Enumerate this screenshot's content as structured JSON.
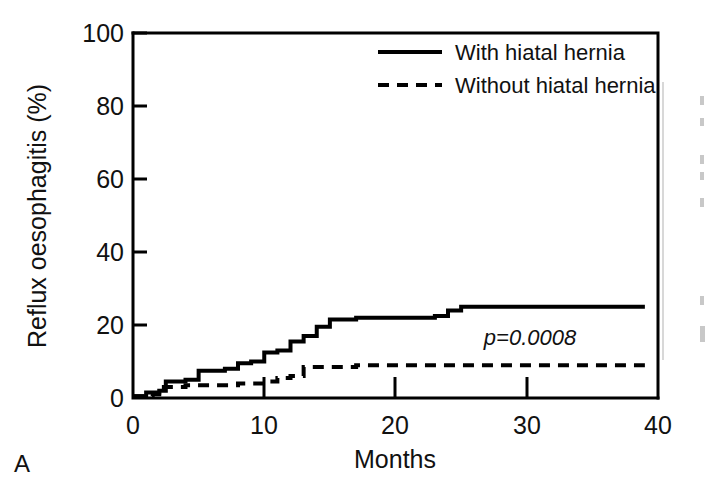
{
  "panel": {
    "label": "A"
  },
  "chart_data": {
    "type": "line",
    "subtype": "kaplan-meier-step",
    "title": "",
    "xlabel": "Months",
    "ylabel": "Reflux oesophagitis (%)",
    "xlim": [
      0,
      40
    ],
    "ylim": [
      0,
      100
    ],
    "xticks": [
      0,
      10,
      20,
      30,
      40
    ],
    "yticks": [
      0,
      20,
      40,
      60,
      80,
      100
    ],
    "grid": false,
    "legend_position": "top-right",
    "annotations": [
      {
        "text": "p=0.0008",
        "x": 28.5,
        "y": 15.5,
        "style": "italic"
      }
    ],
    "series": [
      {
        "name": "With hiatal hernia",
        "style": "solid",
        "points": [
          [
            0,
            0.5
          ],
          [
            1,
            1.5
          ],
          [
            2,
            2.0
          ],
          [
            2.5,
            4.5
          ],
          [
            4,
            5.0
          ],
          [
            5,
            7.5
          ],
          [
            7,
            8.0
          ],
          [
            8,
            9.5
          ],
          [
            9,
            10.0
          ],
          [
            10,
            12.5
          ],
          [
            11,
            13.0
          ],
          [
            12,
            15.5
          ],
          [
            13,
            17.0
          ],
          [
            14,
            19.5
          ],
          [
            15,
            21.5
          ],
          [
            17,
            22.0
          ],
          [
            23,
            22.5
          ],
          [
            24,
            24.0
          ],
          [
            25,
            25.0
          ],
          [
            39,
            25.0
          ]
        ]
      },
      {
        "name": "Without hiatal hernia",
        "style": "dashed",
        "points": [
          [
            0,
            0.5
          ],
          [
            1.5,
            1.0
          ],
          [
            2,
            3.0
          ],
          [
            4,
            3.5
          ],
          [
            8,
            4.0
          ],
          [
            10,
            4.5
          ],
          [
            11,
            5.5
          ],
          [
            12,
            6.0
          ],
          [
            13,
            8.5
          ],
          [
            17,
            9.0
          ],
          [
            39,
            9.0
          ]
        ]
      }
    ]
  },
  "legend": {
    "entries": [
      {
        "label": "With hiatal hernia",
        "style": "solid"
      },
      {
        "label": "Without hiatal hernia",
        "style": "dashed"
      }
    ]
  },
  "axis": {
    "x_tick_labels": [
      "0",
      "10",
      "20",
      "30",
      "40"
    ],
    "y_tick_labels": [
      "0",
      "20",
      "40",
      "60",
      "80",
      "100"
    ],
    "x_title": "Months",
    "y_title": "Reflux oesophagitis (%)"
  }
}
